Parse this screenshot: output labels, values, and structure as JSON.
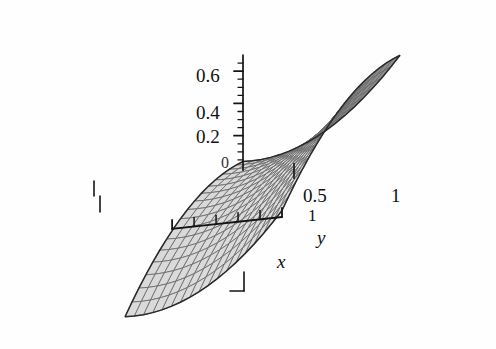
{
  "figure": {
    "kind": "3d-surface-plot",
    "style": "scanned-grayscale-book-figure",
    "background_color": "#fefefe",
    "ink_color": "#1a1a1a"
  },
  "axes": {
    "z": {
      "name": "z",
      "orientation": "vertical",
      "tick_labels": [
        "0.6",
        "0.4",
        "0.2",
        "0"
      ],
      "tick_values": [
        0.6,
        0.4,
        0.2,
        0
      ],
      "minor_ticks": 4,
      "range": [
        0,
        0.7
      ]
    },
    "y": {
      "name": "y",
      "orientation": "right-up",
      "tick_labels": [
        "0.5",
        "1"
      ],
      "tick_values": [
        0.5,
        1
      ],
      "range": [
        0,
        1
      ]
    },
    "x": {
      "name": "x",
      "orientation": "down-left",
      "tick_labels": [
        "0.5",
        "1"
      ],
      "tick_values": [
        0.5,
        1
      ],
      "range": [
        0,
        1
      ]
    }
  },
  "labels": {
    "z_06": "0.6",
    "z_04": "0.4",
    "z_02": "0.2",
    "z_00": "0",
    "y_05": "0.5",
    "y_1": "1",
    "x_05": "0.5",
    "x_1": "1",
    "x_axis_name": "x",
    "y_axis_name": "y"
  },
  "chart_data": {
    "type": "surface",
    "title": "",
    "xlabel": "x",
    "ylabel": "y",
    "zlabel": "",
    "grid": true,
    "legend": "none",
    "xlim": [
      0,
      1
    ],
    "ylim": [
      0,
      1
    ],
    "zlim": [
      0,
      0.7
    ],
    "z_ticks": [
      0,
      0.2,
      0.4,
      0.6
    ],
    "z_tick_labels": [
      "0",
      "0.2",
      "0.4",
      "0.6"
    ],
    "x_ticks": [
      0.5,
      1
    ],
    "x_tick_labels": [
      "0.5",
      "1"
    ],
    "y_ticks": [
      0.5,
      1
    ],
    "y_tick_labels": [
      "0.5",
      "1"
    ],
    "surface_shape": "saddle",
    "mesh": {
      "nx": 17,
      "ny": 17
    },
    "colors": {
      "upper_face": "#d8d8d8",
      "lower_face": "#8b8b8b",
      "mesh_line": "#6a6a6a",
      "silhouette": "#2a2a2a"
    },
    "function_note": "z increases toward large x,y and dips toward the opposite corner, producing two upward wings and two downward wings"
  }
}
